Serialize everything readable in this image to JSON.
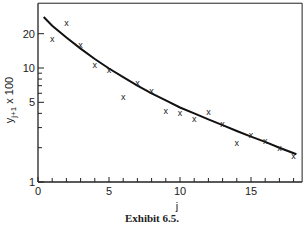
{
  "chart_data": {
    "type": "scatter",
    "title": "",
    "caption": "Exhibit 6.5.",
    "xlabel": "j",
    "ylabel": "y",
    "ylabel_sub": "j+1",
    "ylabel_suffix": " x 100",
    "xlim": [
      0,
      18.6
    ],
    "ylim": [
      1,
      37
    ],
    "yscale": "log",
    "grid": false,
    "x_ticks": [
      0,
      5,
      10,
      15
    ],
    "x_minor_ticks": [
      1,
      2,
      3,
      4,
      6,
      7,
      8,
      9,
      11,
      12,
      13,
      14,
      16,
      17,
      18
    ],
    "y_ticks": [
      1,
      5,
      10,
      20
    ],
    "y_minor_ticks": [
      2,
      3,
      4,
      6,
      7,
      8,
      9
    ],
    "series": [
      {
        "name": "observed",
        "marker": "x",
        "x": [
          1,
          2,
          3,
          4,
          5,
          6,
          7,
          8,
          9,
          10,
          11,
          12,
          13,
          14,
          15,
          16,
          17,
          18
        ],
        "y": [
          18,
          25,
          16,
          10.6,
          9.6,
          5.6,
          7.4,
          6.3,
          4.2,
          4.0,
          3.6,
          4.1,
          3.2,
          2.2,
          2.6,
          2.3,
          2.0,
          1.7
        ]
      },
      {
        "name": "fitted curve",
        "type": "line",
        "x": [
          0.4,
          1,
          2,
          3,
          4,
          5,
          6,
          7,
          8,
          9,
          10,
          11,
          12,
          13,
          14,
          15,
          16,
          17,
          18.2
        ],
        "y": [
          28,
          23.5,
          18.5,
          14.8,
          12.0,
          9.9,
          8.3,
          7.0,
          6.0,
          5.2,
          4.5,
          4.0,
          3.55,
          3.15,
          2.8,
          2.5,
          2.25,
          2.0,
          1.75
        ]
      }
    ]
  }
}
